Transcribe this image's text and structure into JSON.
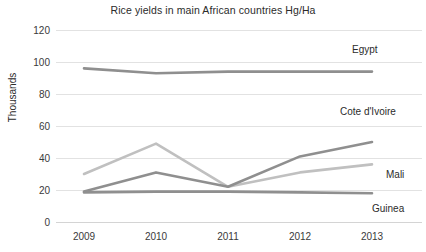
{
  "chart_data": {
    "type": "line",
    "title": "Rice yields in main African countries Hg/Ha",
    "xlabel": "",
    "ylabel": "Thousands",
    "categories": [
      "2009",
      "2010",
      "2011",
      "2012",
      "2013"
    ],
    "x": [
      2009,
      2010,
      2011,
      2012,
      2013
    ],
    "ylim": [
      0,
      120
    ],
    "yticks": [
      0,
      20,
      40,
      60,
      80,
      100,
      120
    ],
    "grid": true,
    "legend_position": "right-inline-labels",
    "series": [
      {
        "name": "Egypt",
        "values": [
          96,
          93,
          94,
          94,
          94
        ],
        "color": "#8f8f8f"
      },
      {
        "name": "Cote d'Ivoire",
        "values": [
          30,
          49,
          22,
          31,
          36
        ],
        "color": "#c0c0c0"
      },
      {
        "name": "Mali",
        "values": [
          19,
          31,
          22,
          41,
          50
        ],
        "color": "#8f8f8f"
      },
      {
        "name": "Guinea",
        "values": [
          18.5,
          19,
          19,
          18.5,
          18
        ],
        "color": "#8f8f8f"
      }
    ]
  },
  "axis": {
    "yticks": [
      {
        "label": "120"
      },
      {
        "label": "100"
      },
      {
        "label": "80"
      },
      {
        "label": "60"
      },
      {
        "label": "40"
      },
      {
        "label": "20"
      },
      {
        "label": "0"
      }
    ],
    "xticks": [
      {
        "label": "2009"
      },
      {
        "label": "2010"
      },
      {
        "label": "2011"
      },
      {
        "label": "2012"
      },
      {
        "label": "2013"
      }
    ],
    "ylabel": "Thousands"
  },
  "labels": {
    "egypt": "Egypt",
    "cote_divoire": "Cote d'Ivoire",
    "mali": "Mali",
    "guinea": "Guinea"
  },
  "title": "Rice yields in main African countries Hg/Ha"
}
